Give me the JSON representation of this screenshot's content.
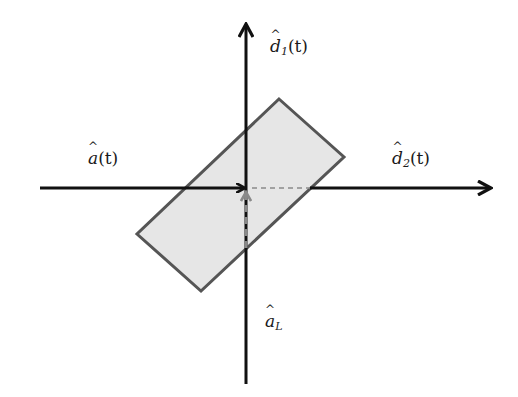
{
  "diagram": {
    "colors": {
      "axis": "#111111",
      "rect_fill": "#e6e6e6",
      "rect_stroke": "#555555",
      "dashed": "#8a8a8a",
      "background": "#ffffff"
    },
    "origin": {
      "x": 246,
      "y": 188
    },
    "axes": {
      "horizontal": {
        "x1": 40,
        "x2": 492,
        "y": 188
      },
      "vertical": {
        "x": 246,
        "y1": 384,
        "y2": 23
      }
    },
    "rectangle": {
      "points": [
        [
          279,
          99
        ],
        [
          344,
          157
        ],
        [
          201,
          291
        ],
        [
          137,
          234
        ]
      ]
    },
    "dashed_lines": {
      "horizontal": {
        "x1": 252,
        "x2": 310,
        "y": 188
      },
      "vertical_arrow": {
        "x": 246,
        "y1": 248,
        "y2": 193
      }
    },
    "labels": {
      "a_t": {
        "base": "a",
        "sub": "",
        "arg": "(t)",
        "x": 88,
        "y": 150
      },
      "d1_t": {
        "base": "d",
        "sub": "1",
        "arg": "(t)",
        "x": 270,
        "y": 38
      },
      "d2_t": {
        "base": "d",
        "sub": "2",
        "arg": "(t)",
        "x": 392,
        "y": 150
      },
      "a_L": {
        "base": "a",
        "sub": "L",
        "arg": "",
        "x": 265,
        "y": 313
      }
    }
  }
}
